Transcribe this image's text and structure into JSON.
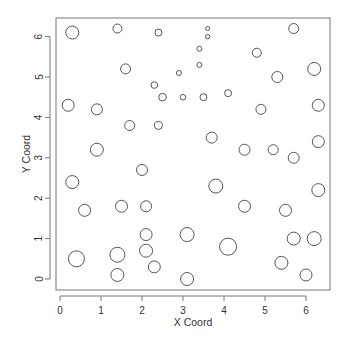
{
  "chart_data": {
    "type": "scatter",
    "title": "",
    "xlabel": "X Coord",
    "ylabel": "Y Coord",
    "xlim": [
      -0.1,
      6.6
    ],
    "ylim": [
      -0.25,
      6.5
    ],
    "xticks": [
      0,
      1,
      2,
      3,
      4,
      5,
      6
    ],
    "yticks": [
      0,
      1,
      2,
      3,
      4,
      5,
      6
    ],
    "grid": false,
    "legend": null,
    "marker": "open-circle",
    "size_note": "circle radius varies per point (pixels)",
    "points": [
      {
        "x": 0.3,
        "y": 6.1,
        "r": 6.5
      },
      {
        "x": 1.4,
        "y": 6.2,
        "r": 4.5
      },
      {
        "x": 2.4,
        "y": 6.1,
        "r": 3.5
      },
      {
        "x": 3.6,
        "y": 6.2,
        "r": 2.0
      },
      {
        "x": 3.6,
        "y": 6.0,
        "r": 2.2
      },
      {
        "x": 1.6,
        "y": 5.2,
        "r": 5.0
      },
      {
        "x": 2.9,
        "y": 5.1,
        "r": 2.5
      },
      {
        "x": 3.4,
        "y": 5.7,
        "r": 2.5
      },
      {
        "x": 3.4,
        "y": 5.3,
        "r": 2.5
      },
      {
        "x": 2.3,
        "y": 4.8,
        "r": 3.3
      },
      {
        "x": 2.5,
        "y": 4.5,
        "r": 3.8
      },
      {
        "x": 3.0,
        "y": 4.5,
        "r": 2.8
      },
      {
        "x": 3.5,
        "y": 4.5,
        "r": 3.5
      },
      {
        "x": 4.1,
        "y": 4.6,
        "r": 3.5
      },
      {
        "x": 0.2,
        "y": 4.3,
        "r": 6.0
      },
      {
        "x": 0.9,
        "y": 4.2,
        "r": 5.5
      },
      {
        "x": 1.7,
        "y": 3.8,
        "r": 5.0
      },
      {
        "x": 2.4,
        "y": 3.8,
        "r": 4.0
      },
      {
        "x": 0.9,
        "y": 3.2,
        "r": 6.5
      },
      {
        "x": 2.0,
        "y": 2.7,
        "r": 5.5
      },
      {
        "x": 0.3,
        "y": 2.4,
        "r": 6.5
      },
      {
        "x": 0.6,
        "y": 1.7,
        "r": 6.0
      },
      {
        "x": 1.5,
        "y": 1.8,
        "r": 6.0
      },
      {
        "x": 2.1,
        "y": 1.8,
        "r": 5.5
      },
      {
        "x": 2.1,
        "y": 1.1,
        "r": 6.0
      },
      {
        "x": 2.1,
        "y": 0.7,
        "r": 6.5
      },
      {
        "x": 2.3,
        "y": 0.3,
        "r": 6.0
      },
      {
        "x": 1.4,
        "y": 0.6,
        "r": 7.5
      },
      {
        "x": 1.4,
        "y": 0.1,
        "r": 6.5
      },
      {
        "x": 0.4,
        "y": 0.5,
        "r": 8.0
      },
      {
        "x": 3.1,
        "y": 1.1,
        "r": 7.0
      },
      {
        "x": 3.1,
        "y": 0.0,
        "r": 6.5
      },
      {
        "x": 4.1,
        "y": 0.8,
        "r": 8.5
      },
      {
        "x": 3.8,
        "y": 2.3,
        "r": 7.0
      },
      {
        "x": 4.5,
        "y": 1.8,
        "r": 6.0
      },
      {
        "x": 5.5,
        "y": 1.7,
        "r": 6.0
      },
      {
        "x": 6.2,
        "y": 1.0,
        "r": 7.0
      },
      {
        "x": 5.7,
        "y": 1.0,
        "r": 6.5
      },
      {
        "x": 5.4,
        "y": 0.4,
        "r": 6.5
      },
      {
        "x": 6.0,
        "y": 0.1,
        "r": 6.0
      },
      {
        "x": 6.3,
        "y": 2.2,
        "r": 6.5
      },
      {
        "x": 3.7,
        "y": 3.5,
        "r": 5.5
      },
      {
        "x": 4.5,
        "y": 3.2,
        "r": 5.5
      },
      {
        "x": 5.2,
        "y": 3.2,
        "r": 5.0
      },
      {
        "x": 5.7,
        "y": 3.0,
        "r": 5.5
      },
      {
        "x": 6.3,
        "y": 3.4,
        "r": 6.0
      },
      {
        "x": 6.3,
        "y": 4.3,
        "r": 6.0
      },
      {
        "x": 4.9,
        "y": 4.2,
        "r": 5.0
      },
      {
        "x": 5.3,
        "y": 5.0,
        "r": 5.5
      },
      {
        "x": 6.2,
        "y": 5.2,
        "r": 6.5
      },
      {
        "x": 4.8,
        "y": 5.6,
        "r": 4.5
      },
      {
        "x": 5.7,
        "y": 6.2,
        "r": 5.0
      }
    ]
  },
  "style": {
    "stroke": "#555555",
    "axis_color": "#777777",
    "text_color": "#333333",
    "background": "#ffffff"
  },
  "layout": {
    "px_x0": 60,
    "px_per_x": 41,
    "px_y0": 279,
    "px_per_y": 40.4,
    "box": {
      "left": 56,
      "top": 18,
      "right": 330,
      "bottom": 290
    }
  }
}
